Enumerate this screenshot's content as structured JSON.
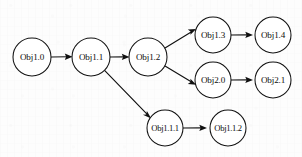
{
  "diagram": {
    "type": "directed-graph",
    "background_color": "#fdfdfd",
    "stroke_color": "#101010",
    "node_fill_color": "#ffffff",
    "width": 302,
    "height": 157,
    "nodes": [
      {
        "id": "obj1-0",
        "label": "Obj1.0",
        "cx": 32,
        "cy": 57,
        "r": 19
      },
      {
        "id": "obj1-1",
        "label": "Obj1.1",
        "cx": 91,
        "cy": 57,
        "r": 19
      },
      {
        "id": "obj1-2",
        "label": "Obj1.2",
        "cx": 148,
        "cy": 57,
        "r": 19
      },
      {
        "id": "obj1-3",
        "label": "Obj1.3",
        "cx": 213,
        "cy": 35,
        "r": 18
      },
      {
        "id": "obj1-4",
        "label": "Obj1.4",
        "cx": 273,
        "cy": 35,
        "r": 18
      },
      {
        "id": "obj2-0",
        "label": "Obj2.0",
        "cx": 213,
        "cy": 80,
        "r": 18
      },
      {
        "id": "obj2-1",
        "label": "Obj2.1",
        "cx": 273,
        "cy": 80,
        "r": 18
      },
      {
        "id": "obj1-1-1",
        "label": "Obj1.1.1",
        "cx": 165,
        "cy": 128,
        "r": 18
      },
      {
        "id": "obj1-1-2",
        "label": "Obj1.1.2",
        "cx": 228,
        "cy": 128,
        "r": 18
      }
    ],
    "edges": [
      {
        "id": "e1",
        "from": "obj1-0",
        "to": "obj1-1",
        "style": "straight"
      },
      {
        "id": "e2",
        "from": "obj1-1",
        "to": "obj1-2",
        "style": "straight"
      },
      {
        "id": "e3",
        "from": "obj1-2",
        "to": "obj1-3",
        "style": "diagonal-up"
      },
      {
        "id": "e4",
        "from": "obj1-2",
        "to": "obj2-0",
        "style": "diagonal-down"
      },
      {
        "id": "e5",
        "from": "obj1-3",
        "to": "obj1-4",
        "style": "straight"
      },
      {
        "id": "e6",
        "from": "obj2-0",
        "to": "obj2-1",
        "style": "straight"
      },
      {
        "id": "e7",
        "from": "obj1-1",
        "to": "obj1-1-1",
        "style": "diagonal-down-long"
      },
      {
        "id": "e8",
        "from": "obj1-1-1",
        "to": "obj1-1-2",
        "style": "straight"
      }
    ]
  }
}
